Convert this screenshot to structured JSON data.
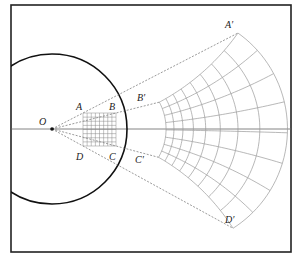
{
  "figure": {
    "type": "geometric-inversion-diagram",
    "frame": {
      "x": 11,
      "y": 5,
      "w": 280,
      "h": 247
    },
    "center_O": {
      "x": 52,
      "y": 129
    },
    "circle_radius": 75,
    "inversion_constant": 7300,
    "source_square": {
      "x0": 83,
      "x1": 116,
      "y0": 113,
      "y1": 146,
      "divisions": 8
    },
    "image_grid_divisions": 8,
    "colors": {
      "frame": "#222222",
      "circle": "#111111",
      "grid": "#999999",
      "axis": "#666666",
      "dashed": "#555555"
    }
  },
  "labels": {
    "O": "O",
    "A": "A",
    "B": "B",
    "C": "C",
    "D": "D",
    "A_prime": "A′",
    "B_prime": "B′",
    "C_prime": "C′",
    "D_prime": "D′"
  }
}
